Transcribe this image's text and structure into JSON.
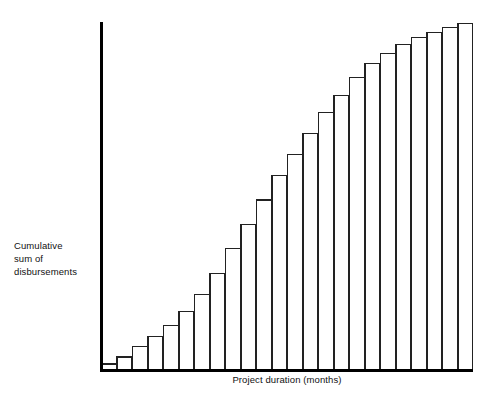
{
  "chart_data": {
    "type": "bar",
    "title": "",
    "subtitle": "",
    "xlabel": "Project duration  (months)",
    "ylabel": "Cumulative\nsum of\ndisbursements",
    "ylabel_lines": [
      "Cumulative",
      "sum of",
      "disbursements"
    ],
    "grid": false,
    "legend": false,
    "legend_position": "none",
    "axis_tick_labels": false,
    "xlim": [
      0,
      24
    ],
    "ylim": [
      0,
      100
    ],
    "categories": [
      1,
      2,
      3,
      4,
      5,
      6,
      7,
      8,
      9,
      10,
      11,
      12,
      13,
      14,
      15,
      16,
      17,
      18,
      19,
      20,
      21,
      22,
      23,
      24
    ],
    "values": [
      2,
      4,
      7,
      10,
      13,
      17,
      22,
      28,
      35,
      42,
      49,
      56,
      62,
      68,
      74,
      79,
      84,
      88,
      91,
      93.5,
      95.5,
      97,
      98.5,
      99.5
    ],
    "series": [
      {
        "name": "Cumulative sum of disbursements",
        "values": [
          2,
          4,
          7,
          10,
          13,
          17,
          22,
          28,
          35,
          42,
          49,
          56,
          62,
          68,
          74,
          79,
          84,
          88,
          91,
          93.5,
          95.5,
          97,
          98.5,
          99.5
        ]
      }
    ],
    "colors": {
      "bar_fill": "#ffffff",
      "bar_stroke": "#222222",
      "axis": "#000000",
      "text": "#111111"
    }
  },
  "figure": {
    "background": "#ffffff",
    "plot_left": 101,
    "plot_right": 473,
    "plot_top": 22,
    "plot_bottom": 371
  }
}
